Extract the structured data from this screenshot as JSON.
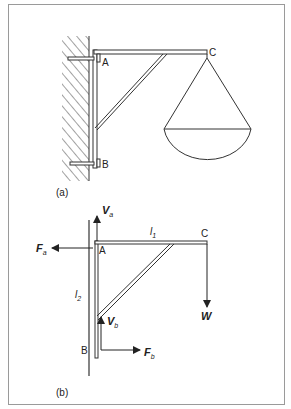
{
  "figure": {
    "colors": {
      "stroke": "#333333",
      "frame": "#9a9a9a",
      "background": "#ffffff"
    },
    "panel_a": {
      "caption": "(a)",
      "points": {
        "top": "A",
        "bottom": "B",
        "tip": "C"
      },
      "elements": [
        "hatched-wall",
        "vertical-bracket",
        "horizontal-beam",
        "diagonal-strut",
        "bolt-a",
        "bolt-b",
        "hanging-basket"
      ]
    },
    "panel_b": {
      "caption": "(b)",
      "points": {
        "top": "A",
        "bottom": "B",
        "tip": "C"
      },
      "lengths": {
        "horizontal": {
          "sym": "l",
          "sub": "1"
        },
        "vertical": {
          "sym": "l",
          "sub": "2"
        }
      },
      "forces": {
        "va": {
          "sym": "V",
          "sub": "a",
          "direction": "up"
        },
        "fa": {
          "sym": "F",
          "sub": "a",
          "direction": "left"
        },
        "vb": {
          "sym": "V",
          "sub": "b",
          "direction": "up"
        },
        "fb": {
          "sym": "F",
          "sub": "b",
          "direction": "right"
        },
        "w": {
          "sym": "W",
          "direction": "down"
        }
      }
    }
  }
}
